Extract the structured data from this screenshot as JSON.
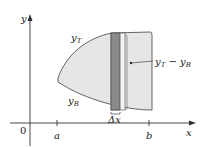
{
  "figure": {
    "axes": {
      "x_label": "x",
      "y_label": "y",
      "origin_label": "0",
      "ticks": [
        {
          "label": "a",
          "x": 57
        },
        {
          "label": "b",
          "x": 149
        }
      ]
    },
    "curves": {
      "top_label": "y",
      "top_sub": "T",
      "bottom_label": "y",
      "bottom_sub": "B"
    },
    "strip": {
      "width_label": "Δx",
      "height_label_main": "y",
      "height_label_sub1": "T",
      "height_label_minus": " − ",
      "height_label_main2": "y",
      "height_label_sub2": "B"
    },
    "colors": {
      "region_fill": "#e6e6e6",
      "strip_fill": "#8a8a8a",
      "outline": "#555555",
      "axis": "#333333"
    }
  }
}
